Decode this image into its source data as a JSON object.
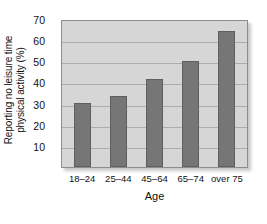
{
  "chart_data": {
    "type": "bar",
    "title": "",
    "xlabel": "Age",
    "ylabel_line1": "Reporting no leisure time",
    "ylabel_line2": "physical activity (%)",
    "categories": [
      "18–24",
      "25–44",
      "45–64",
      "65–74",
      "over 75"
    ],
    "values": [
      30.5,
      34,
      42,
      51,
      65
    ],
    "ylim": [
      0,
      70
    ],
    "yticks": [
      10,
      20,
      30,
      40,
      50,
      60,
      70
    ],
    "grid": true,
    "legend": "none",
    "colors": {
      "bar_fill": "#767676",
      "bar_edge": "#5f5f5f",
      "plot_background": "#d6d6d6",
      "gridline": "#9e9e9e",
      "text": "#111111"
    }
  }
}
